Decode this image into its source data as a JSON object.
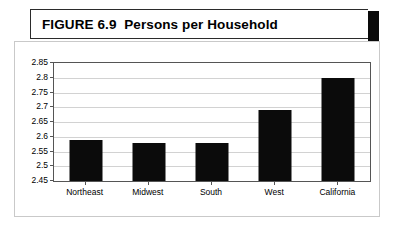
{
  "title": {
    "figure_label": "FIGURE 6.9",
    "text": "FIGURE 6.9  Persons per Household"
  },
  "chart_data": {
    "type": "bar",
    "title": "Persons per Household",
    "categories": [
      "Northeast",
      "Midwest",
      "South",
      "West",
      "California"
    ],
    "values": [
      2.59,
      2.58,
      2.58,
      2.69,
      2.8
    ],
    "xlabel": "",
    "ylabel": "",
    "ylim": [
      2.45,
      2.85
    ],
    "ytick_labels": [
      "2.85",
      "2.8",
      "2.75",
      "2.7",
      "2.65",
      "2.6",
      "2.55",
      "2.5",
      "2.45"
    ],
    "ytick_values": [
      2.85,
      2.8,
      2.75,
      2.7,
      2.65,
      2.6,
      2.55,
      2.5,
      2.45
    ],
    "grid": true,
    "legend": false,
    "bar_color": "#0b0b0b"
  }
}
